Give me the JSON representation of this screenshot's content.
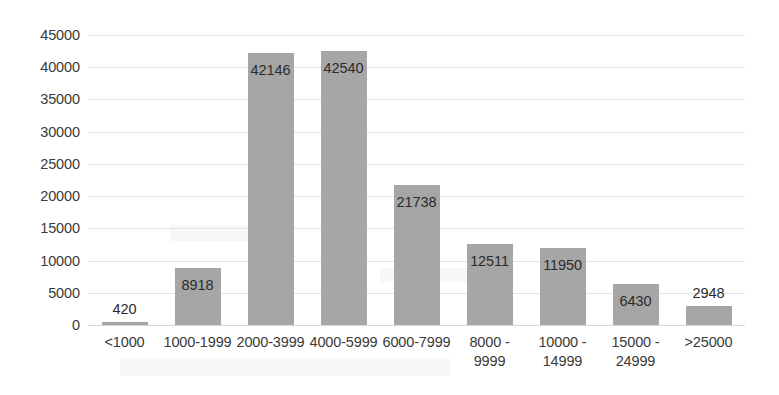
{
  "chart_data": {
    "type": "bar",
    "title": "",
    "subtitle": "",
    "xlabel": "",
    "ylabel": "",
    "categories": [
      "<1000",
      "1000-1999",
      "2000-3999",
      "4000-5999",
      "6000-7999",
      "8000 -\n9999",
      "10000 -\n14999",
      "15000 -\n24999",
      ">25000"
    ],
    "category_lines": [
      [
        "<1000"
      ],
      [
        "1000-1999"
      ],
      [
        "2000-3999"
      ],
      [
        "4000-5999"
      ],
      [
        "6000-7999"
      ],
      [
        "8000 -",
        "9999"
      ],
      [
        "10000 -",
        "14999"
      ],
      [
        "15000 -",
        "24999"
      ],
      [
        ">25000"
      ]
    ],
    "values": [
      420,
      8918,
      42146,
      42540,
      21738,
      12511,
      11950,
      6430,
      2948
    ],
    "data_labels": [
      "420",
      "8918",
      "42146",
      "42540",
      "21738",
      "12511",
      "11950",
      "6430",
      "2948"
    ],
    "ylim": [
      0,
      45000
    ],
    "ytick_labels": [
      "0",
      "5000",
      "10000",
      "15000",
      "20000",
      "25000",
      "30000",
      "35000",
      "40000",
      "45000"
    ],
    "ytick_values": [
      0,
      5000,
      10000,
      15000,
      20000,
      25000,
      30000,
      35000,
      40000,
      45000
    ],
    "grid": true,
    "grid_axis": "y",
    "legend": false,
    "legend_position": "none",
    "series": [
      {
        "name": "",
        "color": "#a6a6a6",
        "values": [
          420,
          8918,
          42146,
          42540,
          21738,
          12511,
          11950,
          6430,
          2948
        ]
      }
    ],
    "colors": {
      "bar": "#a6a6a6",
      "grid": "#e2e2e2",
      "text": "#3a3a3a",
      "background": "#ffffff"
    }
  }
}
